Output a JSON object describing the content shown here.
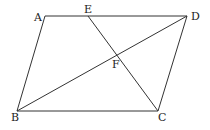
{
  "diagram": {
    "type": "geometry",
    "stroke_color": "#333333",
    "points": {
      "A": {
        "label": "A",
        "x": 45,
        "y": 16,
        "lx": 34,
        "ly": 21
      },
      "E": {
        "label": "E",
        "x": 88,
        "y": 16,
        "lx": 84,
        "ly": 13
      },
      "D": {
        "label": "D",
        "x": 187,
        "y": 16,
        "lx": 191,
        "ly": 20
      },
      "B": {
        "label": "B",
        "x": 17,
        "y": 111,
        "lx": 11,
        "ly": 121
      },
      "C": {
        "label": "C",
        "x": 158,
        "y": 111,
        "lx": 158,
        "ly": 121
      },
      "F": {
        "label": "F",
        "x": 117,
        "y": 57,
        "lx": 112,
        "ly": 68
      }
    },
    "segments": [
      {
        "from": "A",
        "to": "D"
      },
      {
        "from": "A",
        "to": "B"
      },
      {
        "from": "B",
        "to": "C"
      },
      {
        "from": "C",
        "to": "D"
      },
      {
        "from": "B",
        "to": "D"
      },
      {
        "from": "E",
        "to": "C"
      }
    ]
  }
}
